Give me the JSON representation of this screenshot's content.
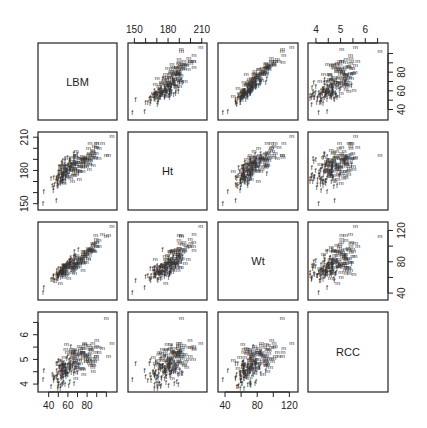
{
  "chart_data": {
    "type": "scatter",
    "subtype": "scatterplot-matrix",
    "variables": [
      "LBM",
      "Ht",
      "Wt",
      "RCC"
    ],
    "point_labels": {
      "male": "m",
      "female": "f"
    },
    "axes": {
      "LBM": {
        "range": [
          32,
          108
        ],
        "ticks": [
          40,
          60,
          80
        ],
        "minor_ticks": [
          40,
          50,
          60,
          70,
          80,
          90,
          100
        ]
      },
      "Ht": {
        "range": [
          147,
          212
        ],
        "ticks": [
          150,
          180,
          210
        ],
        "minor_ticks": [
          150,
          160,
          170,
          180,
          190,
          200,
          210
        ]
      },
      "Wt": {
        "range": [
          35,
          127
        ],
        "ticks": [
          40,
          80,
          120
        ],
        "minor_ticks": [
          40,
          60,
          80,
          100,
          120
        ]
      },
      "RCC": {
        "range": [
          3.8,
          6.8
        ],
        "ticks": [
          4.0,
          5.0,
          6.0
        ],
        "minor_ticks": [
          4.0,
          4.5,
          5.0,
          5.5,
          6.0,
          6.5
        ]
      }
    },
    "axis_placement": {
      "top": [
        {
          "col": 1,
          "var": "Ht"
        },
        {
          "col": 3,
          "var": "RCC"
        }
      ],
      "bottom": [
        {
          "col": 0,
          "var": "LBM"
        },
        {
          "col": 2,
          "var": "Wt"
        }
      ],
      "left": [
        {
          "row": 1,
          "var": "Ht"
        },
        {
          "row": 3,
          "var": "RCC"
        }
      ],
      "right": [
        {
          "row": 0,
          "var": "LBM"
        },
        {
          "row": 2,
          "var": "Wt"
        }
      ]
    },
    "groups": {
      "male": {
        "n": 100,
        "LBM_mean": 75,
        "LBM_sd": 10,
        "Ht_mean": 186,
        "Ht_sd": 8,
        "Wt_mean": 82,
        "Wt_sd": 12,
        "RCC_mean": 5.0,
        "RCC_sd": 0.35
      },
      "female": {
        "n": 100,
        "LBM_mean": 55,
        "LBM_sd": 7,
        "Ht_mean": 175,
        "Ht_sd": 8,
        "Wt_mean": 67,
        "Wt_sd": 9,
        "RCC_mean": 4.4,
        "RCC_sd": 0.3
      }
    },
    "outliers": [
      {
        "label": "m",
        "LBM": 106,
        "Ht": 209,
        "Wt": 123,
        "RCC": 5.6
      },
      {
        "label": "m",
        "LBM": 96,
        "Ht": 203,
        "Wt": 113,
        "RCC": 5.4
      },
      {
        "label": "m",
        "LBM": 100,
        "Ht": 192,
        "Wt": 111,
        "RCC": 6.6
      },
      {
        "label": "m",
        "LBM": 89,
        "Ht": 190,
        "Wt": 112,
        "RCC": 5.2
      },
      {
        "label": "f",
        "LBM": 34,
        "Ht": 148,
        "Wt": 37,
        "RCC": 4.1
      }
    ],
    "title": "",
    "grid": false,
    "legend": null
  },
  "panels": {
    "diagonal_labels": [
      "LBM",
      "Ht",
      "Wt",
      "RCC"
    ]
  }
}
